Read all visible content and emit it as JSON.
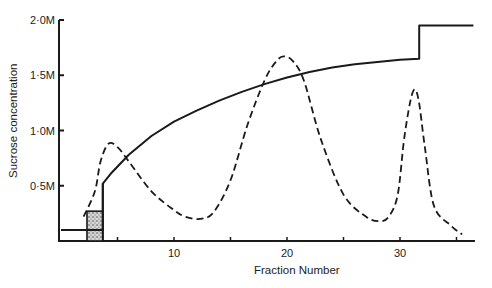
{
  "chart_data": {
    "type": "line",
    "title": "",
    "xlabel": "Fraction Number",
    "ylabel": "Sucrose concentration",
    "xlim": [
      0,
      37
    ],
    "ylim": [
      0,
      2.0
    ],
    "grid": false,
    "legend": "none",
    "x_ticks": [
      {
        "value": 5,
        "label": ""
      },
      {
        "value": 10,
        "label": "10"
      },
      {
        "value": 15,
        "label": ""
      },
      {
        "value": 20,
        "label": "20"
      },
      {
        "value": 25,
        "label": ""
      },
      {
        "value": 30,
        "label": "30"
      },
      {
        "value": 35,
        "label": ""
      }
    ],
    "y_ticks": [
      {
        "value": 0.5,
        "label": "0·5M"
      },
      {
        "value": 1.0,
        "label": "1·0M"
      },
      {
        "value": 1.5,
        "label": "1·5M"
      },
      {
        "value": 2.0,
        "label": "2·0M"
      }
    ],
    "series": [
      {
        "name": "Sucrose gradient",
        "style": "solid",
        "x": [
          0,
          2.3,
          2.3,
          3.7,
          3.7,
          4.5,
          6,
          8,
          10,
          12,
          14,
          16,
          18,
          20,
          22,
          24,
          26,
          28,
          30,
          31.7,
          31.7,
          36.5
        ],
        "y": [
          0.1,
          0.1,
          0.1,
          0.1,
          0.52,
          0.62,
          0.78,
          0.95,
          1.08,
          1.18,
          1.27,
          1.35,
          1.42,
          1.48,
          1.53,
          1.57,
          1.6,
          1.62,
          1.64,
          1.65,
          1.95,
          1.95
        ]
      },
      {
        "name": "Absorbance profile",
        "style": "dashed",
        "x": [
          2,
          3,
          3.5,
          4.2,
          5,
          6,
          8,
          10,
          11,
          12.3,
          13.5,
          15,
          16.5,
          18,
          19,
          19.7,
          20.5,
          21.5,
          23,
          25,
          27,
          28.2,
          29,
          29.8,
          30.4,
          31.1,
          31.6,
          32.2,
          33,
          34.5,
          35.5
        ],
        "y": [
          0.22,
          0.45,
          0.72,
          0.88,
          0.85,
          0.72,
          0.45,
          0.28,
          0.22,
          0.2,
          0.26,
          0.55,
          1.05,
          1.45,
          1.62,
          1.67,
          1.63,
          1.45,
          0.92,
          0.42,
          0.22,
          0.18,
          0.22,
          0.42,
          0.95,
          1.34,
          1.3,
          0.85,
          0.32,
          0.14,
          0.06
        ]
      }
    ],
    "annotations": [
      {
        "type": "stippled-box",
        "x0": 2.3,
        "x1": 3.7,
        "y0": 0,
        "y1": 0.27,
        "description": "sample load zone"
      }
    ]
  }
}
